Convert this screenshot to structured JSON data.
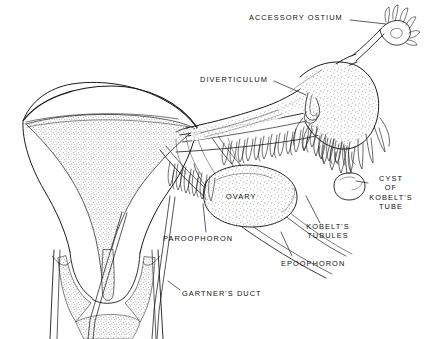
{
  "figure": {
    "type": "anatomical-line-drawing",
    "background_color": "#ffffff",
    "ink_color": "#1a1a1a",
    "stipple_color": "#555555"
  },
  "labels": [
    {
      "id": "accessory-ostium",
      "text": "ACCESSORY OSTIUM",
      "x": 249,
      "y": 17,
      "align": "left",
      "leader": "M 352 21 L 389 21"
    },
    {
      "id": "diverticulum",
      "text": "DIVERTICULUM",
      "x": 200,
      "y": 79,
      "align": "left",
      "leader": "M 274 83 L 307 92"
    },
    {
      "id": "cyst-of-kobelts-tube",
      "text": "CYST\nOF\nKOBELT'S\nTUBE",
      "x": 371,
      "y": 180,
      "align": "left",
      "leader": "M 369 186 L 352 181"
    },
    {
      "id": "kobelts-tubules",
      "text": "KOBELT'S\nTUBULES",
      "x": 303,
      "y": 228,
      "align": "left",
      "leader": "M 324 224 L 313 200"
    },
    {
      "id": "epoophoron",
      "text": "EPOOPHORON",
      "x": 281,
      "y": 264,
      "align": "left",
      "leader": "M 291 260 L 283 240"
    },
    {
      "id": "ovary",
      "text": "OVARY",
      "x": 226,
      "y": 196,
      "align": "left",
      "leader": ""
    },
    {
      "id": "paroophoron",
      "text": "PAROOPHORON",
      "x": 163,
      "y": 238,
      "align": "left",
      "leader": "M 205 234 L 206 212"
    },
    {
      "id": "gartners-duct",
      "text": "GARTNER'S DUCT",
      "x": 182,
      "y": 293,
      "align": "left",
      "leader": "M 180 292 L 169 284"
    }
  ],
  "structures": [
    "uterine fundus and body",
    "endometrial cavity",
    "cervix",
    "vaginal fornices",
    "fallopian tube",
    "fimbriae",
    "broad ligament",
    "ovary",
    "epoophoron tubules",
    "paroophoron tubules",
    "Kobelt's tubules",
    "hydatid cyst of Kobelt",
    "Gartner's duct (left)",
    "Gartner's duct (right)",
    "tubal diverticulum",
    "accessory ostium"
  ]
}
